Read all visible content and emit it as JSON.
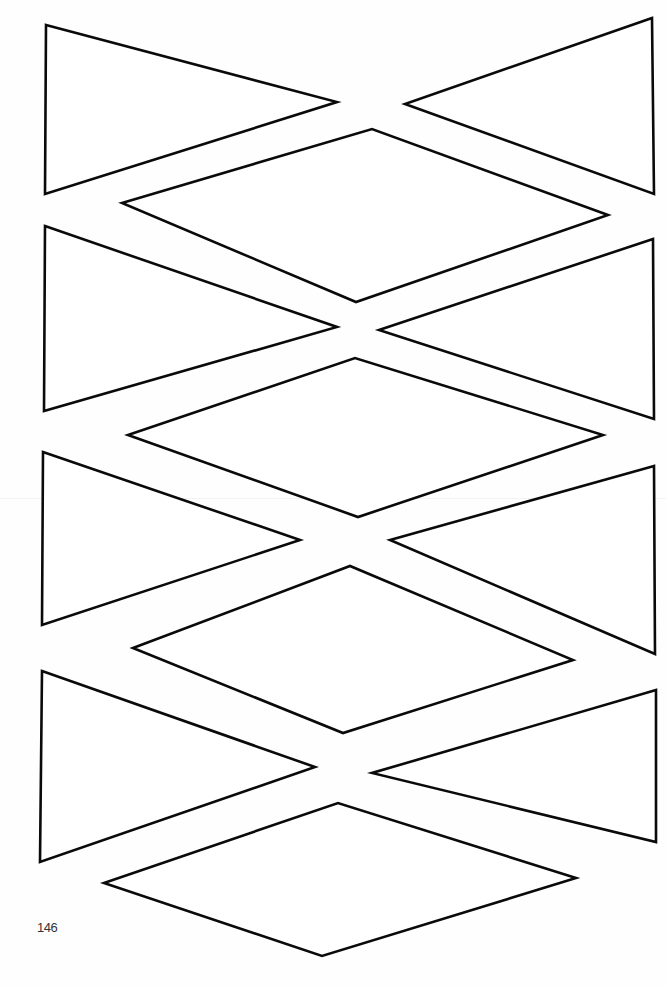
{
  "page": {
    "number": "146",
    "background": "#ffffff",
    "stroke_color": "#0a0a0a"
  },
  "shapes": [
    {
      "name": "triangle-right-pointing-row1",
      "points": "46,25 337,102 45,194"
    },
    {
      "name": "triangle-left-pointing-row1",
      "points": "652,18 405,104 654,194"
    },
    {
      "name": "diamond-row1",
      "points": "122,203 372,129 608,215 356,302"
    },
    {
      "name": "triangle-right-pointing-row2",
      "points": "45,226 337,327 44,411"
    },
    {
      "name": "triangle-left-pointing-row2",
      "points": "653,239 379,330 654,419"
    },
    {
      "name": "diamond-row2",
      "points": "128,435 355,358 603,435 358,517"
    },
    {
      "name": "triangle-right-pointing-row3",
      "points": "43,452 300,540 42,625"
    },
    {
      "name": "triangle-left-pointing-row3",
      "points": "654,466 390,540 655,654"
    },
    {
      "name": "diamond-row3",
      "points": "133,648 350,566 573,660 343,733"
    },
    {
      "name": "triangle-right-pointing-row4",
      "points": "42,671 315,767 40,862"
    },
    {
      "name": "triangle-left-pointing-row4",
      "points": "656,690 372,773 656,842"
    },
    {
      "name": "diamond-row4",
      "points": "104,883 338,803 576,878 322,956"
    }
  ]
}
